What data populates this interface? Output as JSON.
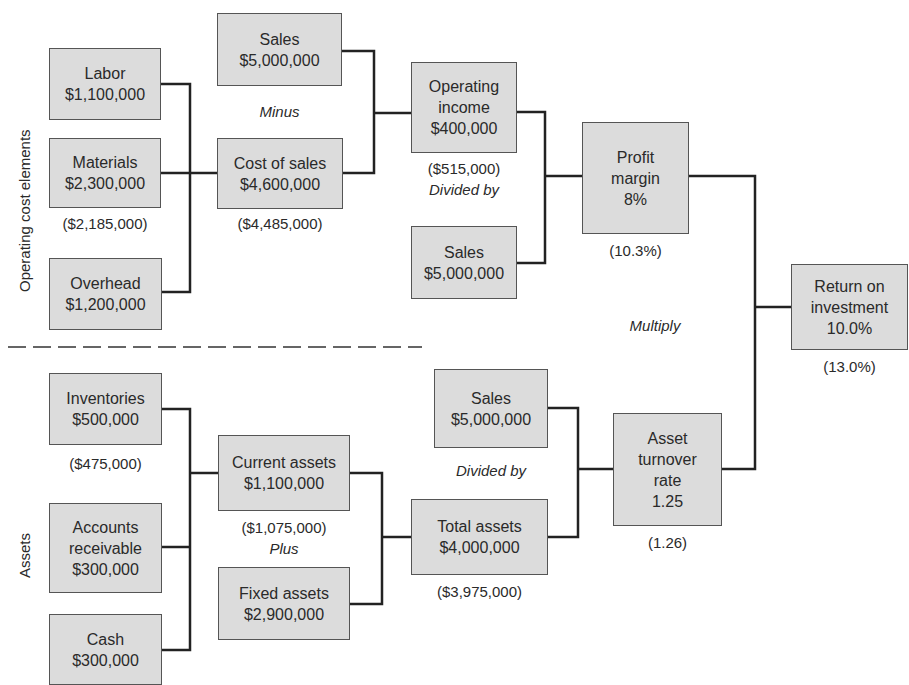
{
  "section_labels": {
    "top": "Operating cost elements",
    "bottom": "Assets"
  },
  "boxes": {
    "labor": {
      "label": "Labor",
      "value": "$1,100,000"
    },
    "materials": {
      "label": "Materials",
      "value": "$2,300,000",
      "note": "($2,185,000)"
    },
    "overhead": {
      "label": "Overhead",
      "value": "$1,200,000"
    },
    "sales_top": {
      "label": "Sales",
      "value": "$5,000,000"
    },
    "cost_of_sales": {
      "label": "Cost of sales",
      "value": "$4,600,000",
      "note": "($4,485,000)"
    },
    "operating_income": {
      "label1": "Operating",
      "label2": "income",
      "value": "$400,000",
      "note": "($515,000)"
    },
    "sales_mid": {
      "label": "Sales",
      "value": "$5,000,000"
    },
    "profit_margin": {
      "label1": "Profit",
      "label2": "margin",
      "value": "8%",
      "note": "(10.3%)"
    },
    "roi": {
      "label1": "Return on",
      "label2": "investment",
      "value": "10.0%",
      "note": "(13.0%)"
    },
    "inventories": {
      "label": "Inventories",
      "value": "$500,000",
      "note": "($475,000)"
    },
    "accounts_receivable": {
      "label1": "Accounts",
      "label2": "receivable",
      "value": "$300,000"
    },
    "cash": {
      "label": "Cash",
      "value": "$300,000"
    },
    "current_assets": {
      "label": "Current assets",
      "value": "$1,100,000",
      "note": "($1,075,000)"
    },
    "fixed_assets": {
      "label": "Fixed assets",
      "value": "$2,900,000"
    },
    "sales_bottom": {
      "label": "Sales",
      "value": "$5,000,000"
    },
    "total_assets": {
      "label": "Total assets",
      "value": "$4,000,000",
      "note": "($3,975,000)"
    },
    "asset_turnover": {
      "label1": "Asset",
      "label2": "turnover",
      "label3": "rate",
      "value": "1.25",
      "note": "(1.26)"
    }
  },
  "operators": {
    "minus": "Minus",
    "divided_by_top": "Divided by",
    "multiply": "Multiply",
    "plus": "Plus",
    "divided_by_bottom": "Divided by"
  },
  "colors": {
    "box_fill": "#dcdcdc",
    "box_border": "#555555",
    "line": "#222222"
  }
}
